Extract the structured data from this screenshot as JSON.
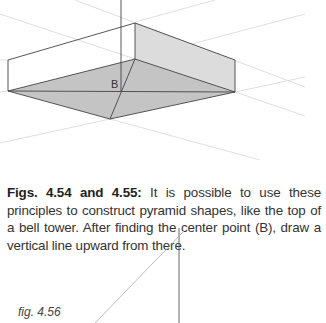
{
  "figure_top": {
    "point_label": "B"
  },
  "caption": {
    "bold": "Figs. 4.54 and 4.55:",
    "text": " It is possible to use these principles to construct pyramid shapes, like the top of a bell tower. After finding the center point (B), draw a vertical line upward from there."
  },
  "figure_bottom": {
    "label": "fig. 4.56"
  }
}
